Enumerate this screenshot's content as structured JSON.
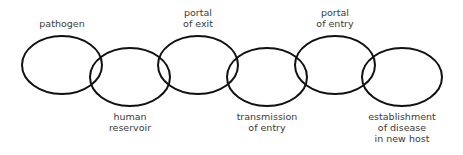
{
  "diagram": {
    "title": "",
    "type": "chain of infection",
    "stroke_color": "#111111",
    "text_color": "#3a3a3a",
    "links": [
      {
        "id": "pathogen",
        "lines": [
          "pathogen"
        ],
        "cx": 62,
        "cy": 65,
        "label_pos": "top"
      },
      {
        "id": "human-reservoir",
        "lines": [
          "human",
          "reservoir"
        ],
        "cx": 130,
        "cy": 77,
        "label_pos": "bottom"
      },
      {
        "id": "portal-of-exit",
        "lines": [
          "portal",
          "of exit"
        ],
        "cx": 198,
        "cy": 65,
        "label_pos": "top"
      },
      {
        "id": "transmission-of-entry",
        "lines": [
          "transmission",
          "of entry"
        ],
        "cx": 267,
        "cy": 77,
        "label_pos": "bottom"
      },
      {
        "id": "portal-of-entry",
        "lines": [
          "portal",
          "of entry"
        ],
        "cx": 335,
        "cy": 65,
        "label_pos": "top"
      },
      {
        "id": "establishment-of-disease",
        "lines": [
          "establishment",
          "of disease",
          "in new host"
        ],
        "cx": 402,
        "cy": 77,
        "label_pos": "bottom"
      }
    ]
  }
}
